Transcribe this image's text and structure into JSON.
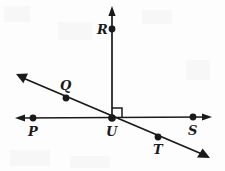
{
  "diagram": {
    "background_color": "#fdfdfd",
    "stroke_color": "#1a1a1a",
    "width": 225,
    "height": 171,
    "labels": {
      "R": "R",
      "Q": "Q",
      "P": "P",
      "U": "U",
      "T": "T",
      "S": "S"
    },
    "points": [
      {
        "name": "R",
        "label": "R",
        "x": 112,
        "y": 29,
        "label_x": 97,
        "label_y": 23
      },
      {
        "name": "Q",
        "label": "Q",
        "x": 66,
        "y": 98,
        "label_x": 60,
        "label_y": 79
      },
      {
        "name": "P",
        "label": "P",
        "x": 33,
        "y": 118,
        "label_x": 28,
        "label_y": 125
      },
      {
        "name": "U",
        "label": "U",
        "x": 112,
        "y": 118,
        "label_x": 107,
        "label_y": 125
      },
      {
        "name": "T",
        "label": "T",
        "x": 158,
        "y": 137,
        "label_x": 153,
        "label_y": 143
      },
      {
        "name": "S",
        "label": "S",
        "x": 193,
        "y": 117,
        "label_x": 188,
        "label_y": 124
      }
    ],
    "lines": [
      {
        "name": "horizontal-line-PS",
        "type": "line",
        "x1": 16,
        "y1": 118,
        "x2": 211,
        "y2": 117,
        "arrow_start": true,
        "arrow_end": true
      },
      {
        "name": "vertical-ray-UR",
        "type": "ray",
        "x1": 112,
        "y1": 118,
        "x2": 112,
        "y2": 8,
        "arrow_start": false,
        "arrow_end": true
      },
      {
        "name": "diagonal-line-QT",
        "type": "line",
        "x1": 18,
        "y1": 76,
        "x2": 207,
        "y2": 157,
        "arrow_start": true,
        "arrow_end": true
      }
    ],
    "right_angle": {
      "name": "right-angle-marker",
      "vertex_x": 112,
      "vertex_y": 118,
      "size": 9,
      "quadrant": "upper-right"
    }
  }
}
